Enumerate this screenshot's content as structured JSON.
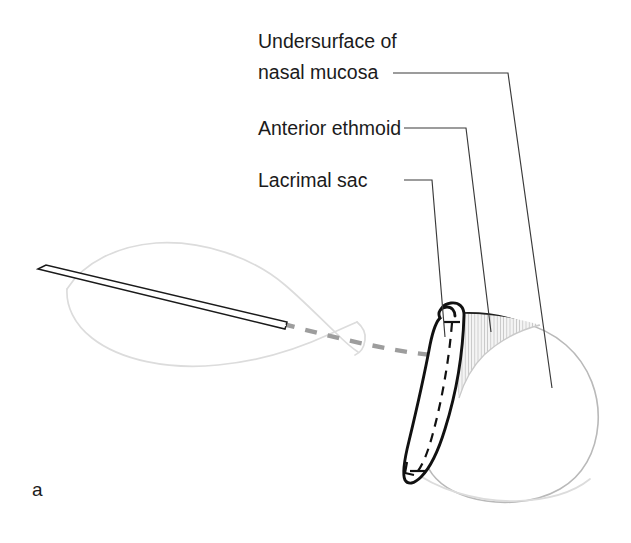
{
  "figure": {
    "panel_letter": "a",
    "background_color": "#ffffff",
    "width": 631,
    "height": 543
  },
  "labels": [
    {
      "id": "nasal-mucosa",
      "line1": "Undersurface of",
      "line2": "nasal mucosa",
      "text_color": "#1b1b1b"
    },
    {
      "id": "anterior-ethmoid",
      "line1": "Anterior ethmoid",
      "line2": "",
      "text_color": "#1b1b1b"
    },
    {
      "id": "lacrimal-sac",
      "line1": "Lacrimal sac",
      "line2": "",
      "text_color": "#1b1b1b"
    }
  ],
  "structures": [
    {
      "id": "globe-orbit",
      "name": "globe outline",
      "stroke": "#dcdcdc"
    },
    {
      "id": "probe",
      "name": "surgical probe",
      "stroke": "#1a1a1a"
    },
    {
      "id": "probe-track",
      "name": "probe trajectory",
      "stroke": "#9d9d9d"
    },
    {
      "id": "lacrimal-sac-flap",
      "name": "lacrimal sac flap",
      "stroke": "#111111"
    },
    {
      "id": "anterior-ethmoid-wedge",
      "name": "anterior ethmoid",
      "fill": "#f2f2f2"
    },
    {
      "id": "nasal-mucosa-flap",
      "name": "nasal mucosa flap",
      "stroke": "#b9b9b9"
    }
  ]
}
